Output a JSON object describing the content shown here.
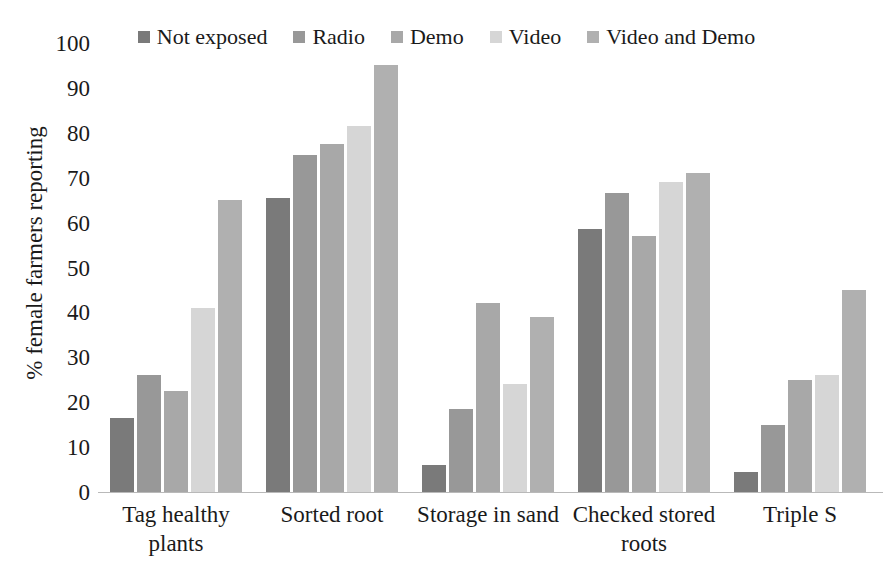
{
  "chart_data": {
    "type": "bar",
    "title": "",
    "subtitle": "",
    "xlabel": "",
    "ylabel": "% female farmers reporting",
    "ylim": [
      0,
      100
    ],
    "ytick_step": 10,
    "yticks": [
      "100",
      "90",
      "80",
      "70",
      "60",
      "50",
      "40",
      "30",
      "20",
      "10",
      "0"
    ],
    "grid": false,
    "legend_position": "top-center",
    "categories": [
      "Tag healthy plants",
      "Sorted root",
      "Storage in sand",
      "Checked stored roots",
      "Triple S"
    ],
    "category_lines": [
      [
        "Tag healthy",
        "plants"
      ],
      [
        "Sorted root"
      ],
      [
        "Storage in sand"
      ],
      [
        "Checked stored",
        "roots"
      ],
      [
        "Triple S"
      ]
    ],
    "series": [
      {
        "name": "Not exposed",
        "color": "#7a7a7a",
        "values": [
          16.5,
          65.5,
          6.0,
          58.5,
          4.5
        ]
      },
      {
        "name": "Radio",
        "color": "#989898",
        "values": [
          26.0,
          75.0,
          18.5,
          66.5,
          15.0
        ]
      },
      {
        "name": "Demo",
        "color": "#a8a8a8",
        "values": [
          22.5,
          77.5,
          42.0,
          57.0,
          25.0
        ]
      },
      {
        "name": "Video",
        "color": "#d6d6d6",
        "values": [
          41.0,
          81.5,
          24.0,
          69.0,
          26.0
        ]
      },
      {
        "name": "Video and Demo",
        "color": "#b0b0b0",
        "values": [
          65.0,
          95.0,
          39.0,
          71.0,
          45.0
        ]
      }
    ]
  },
  "legend": {
    "items": [
      {
        "label": "Not exposed",
        "color": "#7a7a7a"
      },
      {
        "label": "Radio",
        "color": "#989898"
      },
      {
        "label": "Demo",
        "color": "#a8a8a8"
      },
      {
        "label": "Video",
        "color": "#d6d6d6"
      },
      {
        "label": "Video and Demo",
        "color": "#b0b0b0"
      }
    ]
  },
  "axis": {
    "y_title": "% female farmers reporting"
  }
}
